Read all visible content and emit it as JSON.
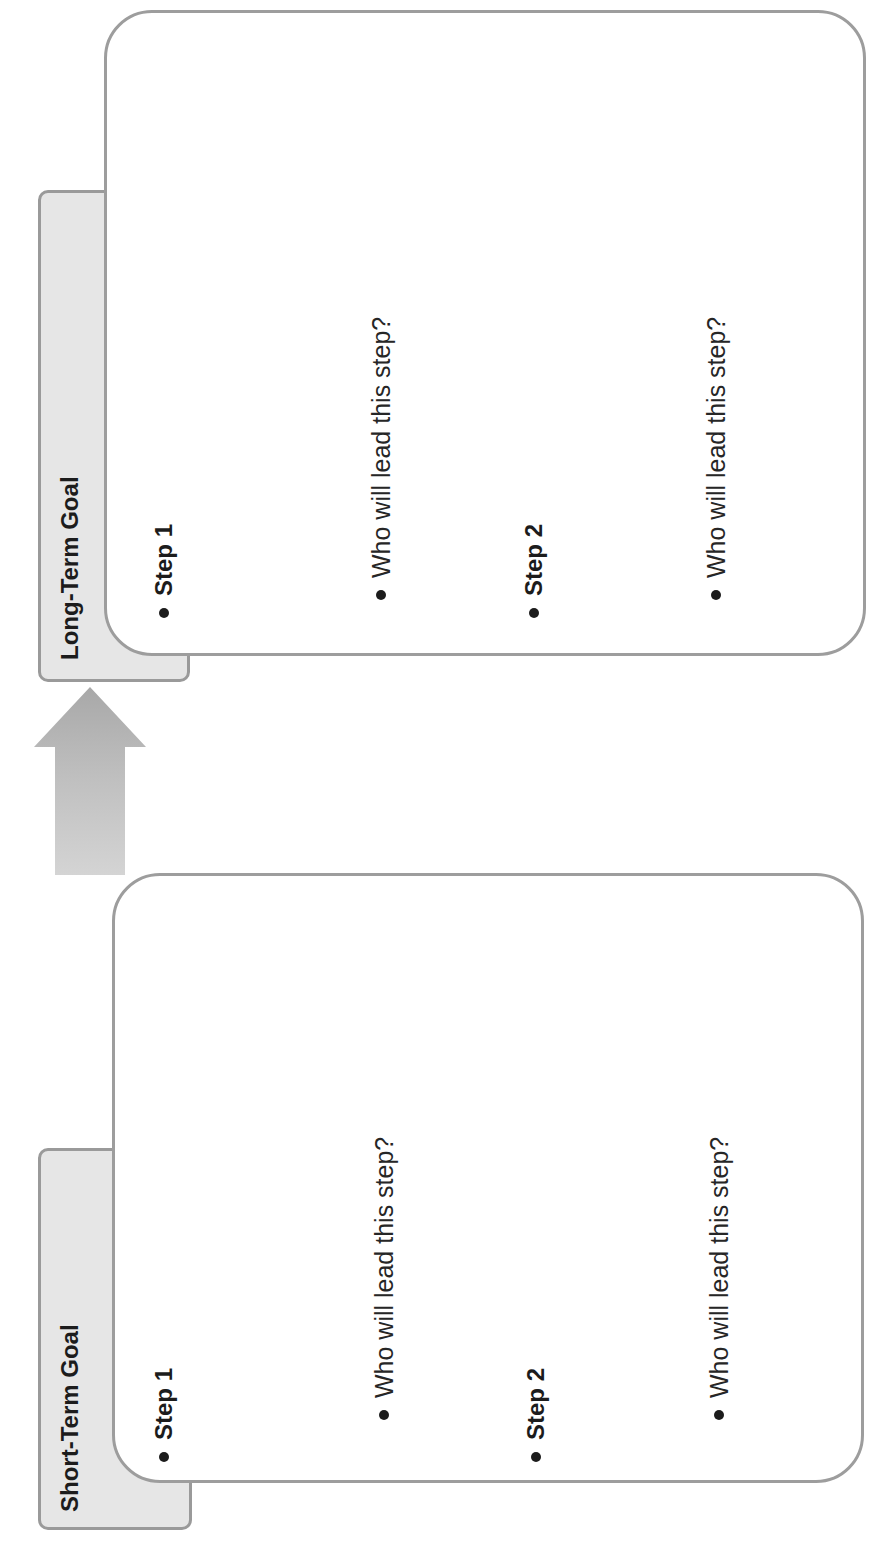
{
  "document": {
    "orientation": "rotated-90-ccw",
    "connector": {
      "icon": "up-arrow-icon",
      "direction": "short-term-to-long-term",
      "color": "#b5b5b5"
    },
    "panels": [
      {
        "id": "long-term",
        "tab_label": "Long-Term Goal",
        "items": [
          {
            "type": "step",
            "label": "Step 1"
          },
          {
            "type": "question",
            "label": "Who will lead this step?"
          },
          {
            "type": "step",
            "label": "Step 2"
          },
          {
            "type": "question",
            "label": "Who will lead this step?"
          }
        ]
      },
      {
        "id": "short-term",
        "tab_label": "Short-Term Goal",
        "items": [
          {
            "type": "step",
            "label": "Step 1"
          },
          {
            "type": "question",
            "label": "Who will lead this step?"
          },
          {
            "type": "step",
            "label": "Step 2"
          },
          {
            "type": "question",
            "label": "Who will lead this step?"
          }
        ]
      }
    ],
    "colors": {
      "tab_fill": "#e6e6e6",
      "border": "#9d9d9d",
      "text": "#1c1c1c",
      "background": "#ffffff"
    }
  }
}
